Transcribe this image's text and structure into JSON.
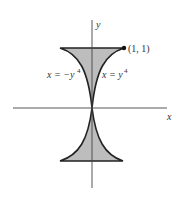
{
  "figure": {
    "axis_labels": {
      "x": "x",
      "y": "y"
    },
    "point_label": "(1, 1)",
    "curve_left_label": "x = −y",
    "curve_left_exp": "4",
    "curve_right_label": "x = y",
    "curve_right_exp": "4",
    "colors": {
      "fill": "#bdbdbd",
      "stroke": "#222222",
      "axis": "#444444"
    }
  }
}
